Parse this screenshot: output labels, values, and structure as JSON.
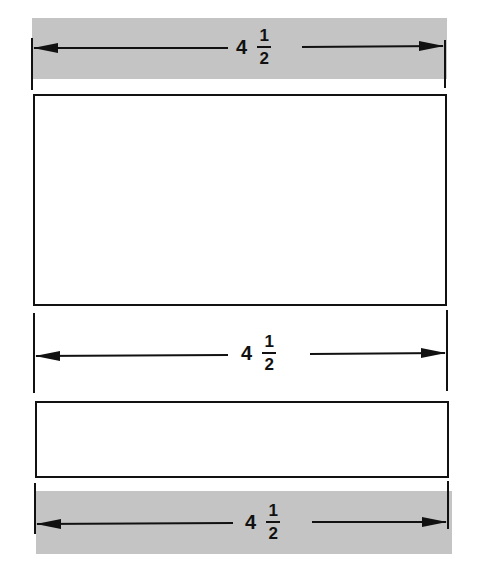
{
  "diagram": {
    "title": "",
    "shapes": [
      {
        "id": "large-rectangle",
        "x": 33,
        "y": 95,
        "w": 414,
        "h": 211
      },
      {
        "id": "small-rectangle",
        "x": 35,
        "y": 401,
        "w": 414,
        "h": 76
      }
    ],
    "dimensions": [
      {
        "id": "top-dimension",
        "whole": "4",
        "numerator": "1",
        "denominator": "2",
        "shaded": true
      },
      {
        "id": "middle-dimension",
        "whole": "4",
        "numerator": "1",
        "denominator": "2",
        "shaded": false
      },
      {
        "id": "bottom-dimension",
        "whole": "4",
        "numerator": "1",
        "denominator": "2",
        "shaded": true
      }
    ],
    "colors": {
      "band": "#c4c4c4",
      "line": "#111111",
      "background": "#ffffff"
    }
  }
}
